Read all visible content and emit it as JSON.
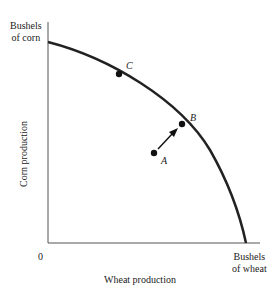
{
  "diagram": {
    "y_axis": {
      "end_label_line1": "Bushels",
      "end_label_line2": "of corn",
      "title": "Corn production"
    },
    "x_axis": {
      "end_label_line1": "Bushels",
      "end_label_line2": "of wheat",
      "title": "Wheat production",
      "origin": "0"
    },
    "points": [
      {
        "id": "A",
        "label": "A",
        "position": "inside frontier"
      },
      {
        "id": "B",
        "label": "B",
        "position": "on frontier"
      },
      {
        "id": "C",
        "label": "C",
        "position": "on frontier"
      }
    ],
    "arrow": {
      "from": "A",
      "to": "B"
    },
    "colors": {
      "curve": "#222222",
      "axis": "#555555"
    }
  }
}
